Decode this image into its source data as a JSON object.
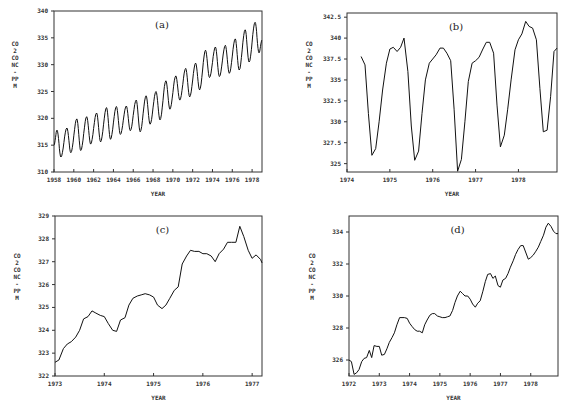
{
  "chart_data": [
    {
      "id": "a",
      "type": "line",
      "panel_label": "(a)",
      "title": "",
      "xlabel": "YEAR",
      "ylabel": "CO2 CONC - PPM",
      "xlim": [
        1958,
        1979.0
      ],
      "ylim": [
        310,
        340
      ],
      "xticks": [
        1958,
        1960,
        1962,
        1964,
        1966,
        1968,
        1970,
        1972,
        1974,
        1976,
        1978
      ],
      "xtick_labels": [
        "1958",
        "1960",
        "1962",
        "1964",
        "1966",
        "1968",
        "1970",
        "1972",
        "1974",
        "1976",
        "1978"
      ],
      "yticks": [
        310,
        315,
        320,
        325,
        330,
        335,
        340
      ],
      "ytick_labels": [
        "310",
        "315",
        "320",
        "325",
        "330",
        "335",
        "340"
      ],
      "grid": false,
      "legend": null,
      "series": [
        {
          "name": "monthly CO2",
          "description": "Seasonal oscillation (~6 ppm amplitude) on rising trend",
          "x": [
            1958.0,
            1958.3,
            1958.7,
            1959.3,
            1959.7,
            1960.3,
            1960.7,
            1961.3,
            1961.7,
            1962.3,
            1962.7,
            1963.3,
            1963.7,
            1964.3,
            1964.7,
            1965.3,
            1965.7,
            1966.3,
            1966.7,
            1967.3,
            1967.7,
            1968.3,
            1968.7,
            1969.3,
            1969.7,
            1970.3,
            1970.7,
            1971.3,
            1971.7,
            1972.3,
            1972.7,
            1973.3,
            1973.7,
            1974.3,
            1974.7,
            1975.3,
            1975.7,
            1976.3,
            1976.7,
            1977.3,
            1977.7,
            1978.3,
            1978.7,
            1979.0
          ],
          "y": [
            315.0,
            317.8,
            312.8,
            318.2,
            313.6,
            319.9,
            314.0,
            320.3,
            315.2,
            321.0,
            315.6,
            322.0,
            316.1,
            322.2,
            317.0,
            322.3,
            317.7,
            323.4,
            317.5,
            324.2,
            318.9,
            325.0,
            319.7,
            327.0,
            321.7,
            327.9,
            323.4,
            329.3,
            324.0,
            330.3,
            325.3,
            332.7,
            327.6,
            333.3,
            327.8,
            333.6,
            328.4,
            334.8,
            329.0,
            336.5,
            330.5,
            337.9,
            332.2,
            334.6
          ]
        }
      ]
    },
    {
      "id": "b",
      "type": "line",
      "panel_label": "(b)",
      "title": "",
      "xlabel": "YEAR",
      "ylabel": "CO2 CONC - PPM",
      "xlim": [
        1974,
        1978.9
      ],
      "ylim": [
        324,
        343
      ],
      "xticks": [
        1974,
        1975,
        1976,
        1977,
        1978
      ],
      "xtick_labels": [
        "1974",
        "1975",
        "1976",
        "1977",
        "1978"
      ],
      "yticks": [
        325,
        327.5,
        330,
        332.5,
        335,
        337.5,
        340,
        342.5
      ],
      "ytick_labels": [
        "325",
        "327.5",
        "330",
        "332.5",
        "335",
        "337.5",
        "340",
        "342.5"
      ],
      "grid": false,
      "legend": null,
      "series": [
        {
          "name": "monthly CO2",
          "x": [
            1974.33,
            1974.42,
            1974.5,
            1974.58,
            1974.67,
            1974.75,
            1974.83,
            1974.92,
            1975.0,
            1975.08,
            1975.17,
            1975.25,
            1975.33,
            1975.42,
            1975.5,
            1975.58,
            1975.67,
            1975.75,
            1975.83,
            1975.92,
            1976.0,
            1976.08,
            1976.17,
            1976.25,
            1976.33,
            1976.42,
            1976.5,
            1976.58,
            1976.67,
            1976.75,
            1976.83,
            1976.92,
            1977.0,
            1977.08,
            1977.17,
            1977.25,
            1977.33,
            1977.42,
            1977.5,
            1977.58,
            1977.67,
            1977.75,
            1977.83,
            1977.92,
            1978.0,
            1978.08,
            1978.17,
            1978.25,
            1978.33,
            1978.42,
            1978.5,
            1978.58,
            1978.67,
            1978.75,
            1978.83,
            1978.9
          ],
          "y": [
            337.8,
            336.8,
            331.0,
            326.0,
            326.8,
            330.0,
            333.8,
            337.0,
            338.7,
            338.9,
            338.4,
            338.9,
            340.0,
            336.0,
            329.5,
            325.4,
            326.5,
            331.0,
            335.0,
            337.0,
            337.5,
            338.0,
            338.8,
            338.8,
            338.2,
            337.3,
            331.5,
            324.1,
            325.5,
            330.0,
            334.8,
            337.0,
            337.3,
            337.7,
            338.7,
            339.5,
            339.5,
            338.2,
            332.0,
            327.0,
            328.4,
            331.5,
            335.0,
            338.6,
            339.8,
            340.5,
            342.0,
            341.4,
            341.2,
            339.8,
            334.0,
            328.8,
            329.0,
            333.0,
            338.4,
            338.8
          ]
        }
      ]
    },
    {
      "id": "c",
      "type": "line",
      "panel_label": "(c)",
      "title": "",
      "xlabel": "YEAR",
      "ylabel": "CO2 CONC - PPM",
      "xlim": [
        1973,
        1977.2
      ],
      "ylim": [
        322,
        329
      ],
      "xticks": [
        1973,
        1974,
        1975,
        1976,
        1977
      ],
      "xtick_labels": [
        "1973",
        "1974",
        "1975",
        "1976",
        "1977"
      ],
      "yticks": [
        322,
        323,
        324,
        325,
        326,
        327,
        328,
        329
      ],
      "ytick_labels": [
        "322",
        "323",
        "324",
        "325",
        "326",
        "327",
        "328",
        "329"
      ],
      "grid": false,
      "legend": null,
      "series": [
        {
          "name": "smoothed CO2",
          "x": [
            1973.0,
            1973.08,
            1973.17,
            1973.25,
            1973.33,
            1973.42,
            1973.5,
            1973.58,
            1973.67,
            1973.75,
            1973.83,
            1973.92,
            1974.0,
            1974.08,
            1974.17,
            1974.25,
            1974.33,
            1974.42,
            1974.5,
            1974.58,
            1974.67,
            1974.75,
            1974.83,
            1974.92,
            1975.0,
            1975.08,
            1975.17,
            1975.25,
            1975.33,
            1975.42,
            1975.5,
            1975.58,
            1975.67,
            1975.75,
            1975.83,
            1975.92,
            1976.0,
            1976.08,
            1976.17,
            1976.25,
            1976.33,
            1976.42,
            1976.5,
            1976.58,
            1976.67,
            1976.75,
            1976.83,
            1976.92,
            1977.0,
            1977.08,
            1977.17,
            1977.2
          ],
          "y": [
            322.6,
            322.7,
            323.2,
            323.4,
            323.5,
            323.7,
            324.0,
            324.5,
            324.6,
            324.85,
            324.75,
            324.65,
            324.6,
            324.3,
            324.0,
            323.95,
            324.45,
            324.55,
            325.1,
            325.4,
            325.5,
            325.55,
            325.6,
            325.55,
            325.45,
            325.1,
            324.95,
            325.1,
            325.4,
            325.75,
            325.9,
            326.9,
            327.25,
            327.5,
            327.45,
            327.45,
            327.35,
            327.35,
            327.25,
            327.0,
            327.35,
            327.55,
            327.85,
            327.85,
            327.85,
            328.55,
            328.1,
            327.5,
            327.15,
            327.3,
            327.1,
            326.95
          ]
        }
      ]
    },
    {
      "id": "d",
      "type": "line",
      "panel_label": "(d)",
      "title": "",
      "xlabel": "YEAR",
      "ylabel": "CO2 CONC - PPM",
      "xlim": [
        1972,
        1978.9
      ],
      "ylim": [
        325,
        335
      ],
      "xticks": [
        1972,
        1973,
        1974,
        1975,
        1976,
        1977,
        1978
      ],
      "xtick_labels": [
        "1972",
        "1973",
        "1974",
        "1975",
        "1976",
        "1977",
        "1978"
      ],
      "yticks": [
        326,
        328,
        330,
        332,
        334
      ],
      "ytick_labels": [
        "326",
        "328",
        "330",
        "332",
        "334"
      ],
      "grid": false,
      "legend": null,
      "series": [
        {
          "name": "deseasonalized CO2",
          "x": [
            1972.0,
            1972.08,
            1972.17,
            1972.25,
            1972.33,
            1972.42,
            1972.5,
            1972.58,
            1972.67,
            1972.75,
            1972.83,
            1972.92,
            1973.0,
            1973.08,
            1973.17,
            1973.25,
            1973.33,
            1973.42,
            1973.5,
            1973.58,
            1973.67,
            1973.75,
            1973.83,
            1973.92,
            1974.0,
            1974.08,
            1974.17,
            1974.25,
            1974.33,
            1974.42,
            1974.5,
            1974.58,
            1974.67,
            1974.75,
            1974.83,
            1974.92,
            1975.0,
            1975.08,
            1975.17,
            1975.25,
            1975.33,
            1975.42,
            1975.5,
            1975.58,
            1975.67,
            1975.75,
            1975.83,
            1975.92,
            1976.0,
            1976.08,
            1976.17,
            1976.25,
            1976.33,
            1976.42,
            1976.5,
            1976.58,
            1976.67,
            1976.75,
            1976.83,
            1976.92,
            1977.0,
            1977.08,
            1977.17,
            1977.25,
            1977.33,
            1977.42,
            1977.5,
            1977.58,
            1977.67,
            1977.75,
            1977.83,
            1977.92,
            1978.0,
            1978.08,
            1978.17,
            1978.25,
            1978.33,
            1978.42,
            1978.5,
            1978.58,
            1978.67,
            1978.75,
            1978.83,
            1978.9
          ],
          "y": [
            326.0,
            325.9,
            325.1,
            325.2,
            325.4,
            325.9,
            326.1,
            326.15,
            326.6,
            326.15,
            326.9,
            326.85,
            326.85,
            326.3,
            326.35,
            326.7,
            327.1,
            327.4,
            327.7,
            328.2,
            328.65,
            328.65,
            328.65,
            328.6,
            328.3,
            328.1,
            327.9,
            327.8,
            327.8,
            327.7,
            328.2,
            328.5,
            328.8,
            328.9,
            328.9,
            328.75,
            328.7,
            328.65,
            328.65,
            328.7,
            328.75,
            329.1,
            329.6,
            330.0,
            330.3,
            330.15,
            330.0,
            330.0,
            329.8,
            329.5,
            329.3,
            329.55,
            329.7,
            330.3,
            330.9,
            331.35,
            331.4,
            331.1,
            331.25,
            330.65,
            330.55,
            331.0,
            331.1,
            331.4,
            331.8,
            332.2,
            332.6,
            332.9,
            333.15,
            333.15,
            332.75,
            332.3,
            332.4,
            332.55,
            332.8,
            333.05,
            333.4,
            333.8,
            334.3,
            334.55,
            334.35,
            334.05,
            333.9,
            333.9
          ]
        }
      ]
    }
  ],
  "panels": {
    "a": {
      "label": "(a)",
      "xlabel": "YEAR",
      "ylabel": "CO2 CONC - PPM"
    },
    "b": {
      "label": "(b)",
      "xlabel": "YEAR",
      "ylabel": "CO2 CONC - PPM"
    },
    "c": {
      "label": "(c)",
      "xlabel": "YEAR",
      "ylabel": "CO2 CONC - PPM"
    },
    "d": {
      "label": "(d)",
      "xlabel": "YEAR",
      "ylabel": "CO2 CONC - PPM"
    }
  },
  "style": {
    "line_color": "#111111",
    "frame_color": "#333333",
    "background": "#ffffff"
  }
}
